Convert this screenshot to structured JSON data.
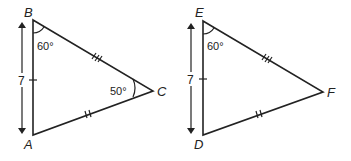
{
  "diagram": {
    "title": "",
    "triangles": [
      {
        "name": "ABC",
        "vertices": {
          "A": "A",
          "B": "B",
          "C": "C"
        },
        "angle_B": "60°",
        "angle_C": "50°",
        "side_AB_length": "7",
        "side_BC_marks": "triple tick",
        "side_AC_marks": "double tick"
      },
      {
        "name": "DEF",
        "vertices": {
          "D": "D",
          "E": "E",
          "F": "F"
        },
        "angle_E": "60°",
        "side_DE_length": "7",
        "side_EF_marks": "triple tick",
        "side_DF_marks": "double tick"
      }
    ],
    "colors": {
      "stroke": "#222222",
      "background": "#ffffff"
    }
  }
}
